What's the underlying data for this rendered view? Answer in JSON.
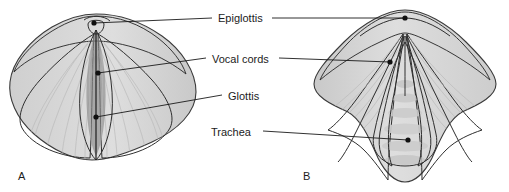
{
  "figure": {
    "background_color": "#ffffff",
    "ink_color": "#1c1c1c",
    "palette": {
      "outer_fold_light": "#d9d9d9",
      "outer_fold_mid": "#c6c6c6",
      "vestibular_fold": "#b4b4b4",
      "cord_surface": "#cfcfcf",
      "glottis_dark": "#9b9b9b",
      "trachea_wall": "#a7a7a7",
      "tracheal_ring": "#c9c9c9",
      "outline": "#3a3a3a",
      "leader_line": "#1a1a1a",
      "dot": "#101010"
    }
  },
  "labels": [
    {
      "id": "epiglottis",
      "text": "Epiglottis",
      "x": 218,
      "y": 19,
      "anchor": "start"
    },
    {
      "id": "vocal-cords",
      "text": "Vocal cords",
      "x": 212,
      "y": 60,
      "anchor": "start"
    },
    {
      "id": "glottis",
      "text": "Glottis",
      "x": 228,
      "y": 97,
      "anchor": "start"
    },
    {
      "id": "trachea",
      "text": "Trachea",
      "x": 211,
      "y": 133,
      "anchor": "start"
    }
  ],
  "panels": [
    {
      "id": "panel-a",
      "letter": "A",
      "letter_x": 18,
      "letter_y": 180,
      "caption": "Vocal cords closed (adducted) - narrow slit-like glottis"
    },
    {
      "id": "panel-b",
      "letter": "B",
      "letter_x": 303,
      "letter_y": 180,
      "caption": "Vocal cords open (abducted) - triangular glottis exposing trachea"
    }
  ],
  "leaders": [
    {
      "id": "leader-epiglottis-a",
      "label": "epiglottis",
      "panel": "panel-a",
      "path": "M 212 18 L 94 23",
      "dot_x": 94,
      "dot_y": 23
    },
    {
      "id": "leader-epiglottis-b",
      "label": "epiglottis",
      "panel": "panel-b",
      "path": "M 272 18 L 405 18",
      "dot_x": 405,
      "dot_y": 18
    },
    {
      "id": "leader-vocal-cords-a",
      "label": "vocal-cords",
      "panel": "panel-a",
      "path": "M 206 58 L 98 73",
      "dot_x": 98,
      "dot_y": 73
    },
    {
      "id": "leader-vocal-cords-b",
      "label": "vocal-cords",
      "panel": "panel-b",
      "path": "M 279 58 L 390 62",
      "dot_x": 390,
      "dot_y": 62
    },
    {
      "id": "leader-glottis-a",
      "label": "glottis",
      "panel": "panel-a",
      "path": "M 222 95 L 96 117",
      "dot_x": 96,
      "dot_y": 117
    },
    {
      "id": "leader-trachea-b",
      "label": "trachea",
      "panel": "panel-b",
      "path": "M 263 131 L 408 140",
      "dot_x": 408,
      "dot_y": 140
    }
  ]
}
